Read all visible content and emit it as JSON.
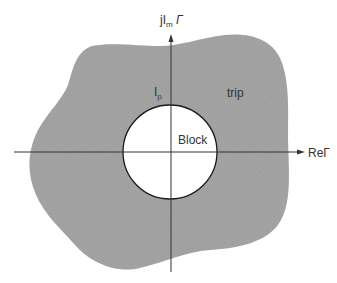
{
  "diagram": {
    "type": "impedance-plane region diagram",
    "axes": {
      "vertical_label": {
        "main": "jI",
        "sub": "m",
        "suffix": " Γ"
      },
      "horizontal_label": "ReΓ"
    },
    "regions": {
      "trip": "trip",
      "block": "Block",
      "boundary_label": {
        "main": "I",
        "sub": "p"
      }
    },
    "colors": {
      "trip_fill": "#a9a9a9",
      "block_fill": "#ffffff",
      "axis": "#333333",
      "outline": "#1a1a1a"
    }
  }
}
